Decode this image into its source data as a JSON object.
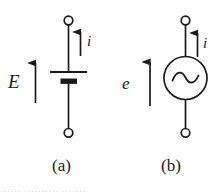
{
  "figure": {
    "kind": "circuit-diagram",
    "background_color": "#ffffff",
    "ink_color": "#1a1a1a",
    "panels": [
      {
        "id": "a",
        "caption": "(a)",
        "source_type": "battery-dc-emf",
        "source_symbol_name": "battery-cell",
        "labels": {
          "voltage": "E",
          "current": "i"
        },
        "arrows": {
          "voltage_direction": "up",
          "current_direction": "up"
        },
        "terminals": {
          "top": "open-circle",
          "bottom": "open-circle"
        }
      },
      {
        "id": "b",
        "caption": "(b)",
        "source_type": "ac-source",
        "source_symbol_name": "sine-wave-circle",
        "labels": {
          "voltage": "e",
          "current": "i"
        },
        "arrows": {
          "voltage_direction": "up",
          "current_direction": "up"
        },
        "terminals": {
          "top": "open-circle",
          "bottom": "open-circle"
        }
      }
    ],
    "bottom_bleed_text": "······      ··········      ·······"
  }
}
